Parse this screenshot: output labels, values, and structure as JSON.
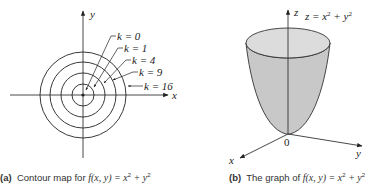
{
  "figure_a": {
    "caption_tag": "(a)",
    "caption_text": "Contour map for ",
    "caption_func": "f(x, y) = x",
    "caption_mid": " + y",
    "axis_x_label": "x",
    "axis_y_label": "y",
    "contours": [
      {
        "k_label": "k = 0",
        "k": 0,
        "radius": 0
      },
      {
        "k_label": "k = 1",
        "k": 1,
        "radius": 1
      },
      {
        "k_label": "k = 4",
        "k": 4,
        "radius": 2
      },
      {
        "k_label": "k = 9",
        "k": 9,
        "radius": 3
      },
      {
        "k_label": "k = 16",
        "k": 16,
        "radius": 4
      }
    ]
  },
  "figure_b": {
    "caption_tag": "(b)",
    "caption_text": "The graph of ",
    "caption_func": "f(x, y) = x",
    "caption_mid": " + y",
    "surface_label": "z = x",
    "surface_label_mid": " + y",
    "sup2": "2",
    "axis_x_label": "x",
    "axis_y_label": "y",
    "axis_z_label": "z",
    "origin_label": "0",
    "fill_color": "#c8c8c8",
    "top_color": "#dcdcdc"
  }
}
